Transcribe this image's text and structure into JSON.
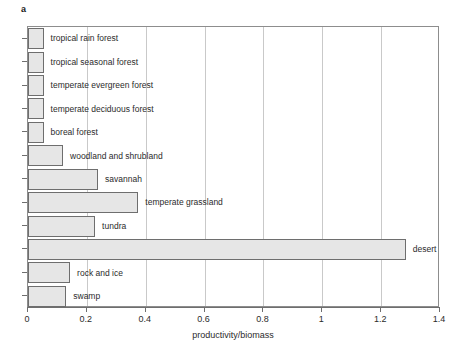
{
  "panel": {
    "letter": "a"
  },
  "chart_data": {
    "type": "bar",
    "orientation": "horizontal",
    "title": "",
    "xlabel": "productivity/biomass",
    "ylabel": "",
    "xlim": [
      0,
      1.4
    ],
    "xticks": [
      "0",
      "0.2",
      "0.4",
      "0.6",
      "0.8",
      "1",
      "1.2",
      "1.4"
    ],
    "xtick_values": [
      0,
      0.2,
      0.4,
      0.6,
      0.8,
      1.0,
      1.2,
      1.4
    ],
    "grid": "vertical",
    "legend": "none",
    "categories": [
      "tropical rain forest",
      "tropical seasonal forest",
      "temperate evergreen forest",
      "temperate deciduous forest",
      "boreal forest",
      "woodland and shrubland",
      "savannah",
      "temperate grassland",
      "tundra",
      "desert",
      "rock and ice",
      "swamp"
    ],
    "values": [
      0.053,
      0.053,
      0.053,
      0.053,
      0.053,
      0.119,
      0.238,
      0.375,
      0.228,
      1.284,
      0.143,
      0.13
    ],
    "bar_color": "#e6e6e6",
    "bar_edge_color": "#6e6e6e",
    "axis_color": "#6e6e6e",
    "grid_color": "#c9c9c9"
  }
}
